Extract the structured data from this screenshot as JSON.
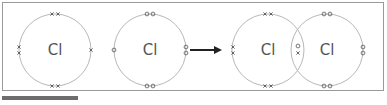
{
  "diagram": {
    "colors": {
      "circle": "#b8b8b8",
      "electron": "#555555",
      "arrow": "#222222",
      "frame": "#9a9a9a"
    },
    "reactants": [
      {
        "symbol": "Cl",
        "electron_marker": "cross",
        "outer_electrons": 7
      },
      {
        "symbol": "Cl",
        "electron_marker": "dot",
        "outer_electrons": 7
      }
    ],
    "arrow": {
      "direction": "right"
    },
    "product": {
      "atoms": [
        {
          "symbol": "Cl",
          "electron_marker": "cross"
        },
        {
          "symbol": "Cl",
          "electron_marker": "dot"
        }
      ],
      "shared_pair": [
        "dot",
        "cross"
      ]
    }
  }
}
